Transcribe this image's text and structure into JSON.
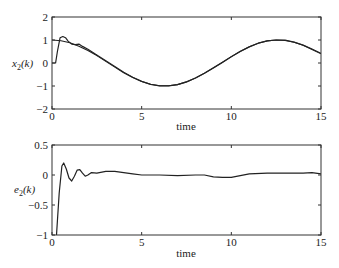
{
  "chart_data": [
    {
      "type": "line",
      "title": "",
      "xlabel": "time",
      "ylabel": "x2(k)",
      "ylabel_main": "x",
      "ylabel_sub": "2",
      "ylabel_tail": "(k)",
      "xlim": [
        0,
        15
      ],
      "ylim": [
        -2,
        2
      ],
      "xticks": [
        0,
        5,
        10,
        15
      ],
      "xtick_labels": [
        "0",
        "5",
        "10",
        "15"
      ],
      "yticks": [
        -2,
        -1,
        0,
        1,
        2
      ],
      "ytick_labels": [
        "−2",
        "−1",
        "0",
        "1",
        "2"
      ],
      "grid": false,
      "legend": null,
      "series": [
        {
          "name": "reference",
          "x": [
            0,
            0.5,
            1,
            1.5,
            2,
            2.5,
            3,
            3.5,
            4,
            4.5,
            5,
            5.5,
            6,
            6.5,
            7,
            7.5,
            8,
            8.5,
            9,
            9.5,
            10,
            10.5,
            11,
            11.5,
            12,
            12.5,
            13,
            13.5,
            14,
            14.5,
            15
          ],
          "values": [
            1.0,
            0.97,
            0.88,
            0.73,
            0.54,
            0.32,
            0.07,
            -0.18,
            -0.42,
            -0.63,
            -0.8,
            -0.92,
            -0.99,
            -0.99,
            -0.94,
            -0.82,
            -0.65,
            -0.45,
            -0.21,
            0.03,
            0.28,
            0.51,
            0.71,
            0.86,
            0.96,
            1.0,
            0.98,
            0.9,
            0.77,
            0.59,
            0.4
          ]
        },
        {
          "name": "actual",
          "x": [
            0,
            0.2,
            0.3,
            0.45,
            0.6,
            0.75,
            0.9,
            1.1,
            1.3,
            1.5,
            1.7,
            2,
            2.5,
            3,
            3.5,
            4,
            4.5,
            5,
            5.5,
            6,
            6.5,
            7,
            7.5,
            8,
            8.5,
            9,
            9.5,
            10,
            10.5,
            11,
            11.5,
            12,
            12.5,
            13,
            13.5,
            14,
            14.5,
            15
          ],
          "values": [
            0.0,
            0.0,
            0.5,
            1.1,
            1.15,
            1.1,
            0.95,
            0.82,
            0.8,
            0.82,
            0.72,
            0.6,
            0.35,
            0.1,
            -0.15,
            -0.4,
            -0.62,
            -0.8,
            -0.93,
            -0.99,
            -0.99,
            -0.94,
            -0.82,
            -0.65,
            -0.45,
            -0.22,
            0.02,
            0.27,
            0.5,
            0.7,
            0.86,
            0.96,
            1.0,
            0.99,
            0.91,
            0.78,
            0.61,
            0.42
          ]
        }
      ]
    },
    {
      "type": "line",
      "title": "",
      "xlabel": "time",
      "ylabel": "e2(k)",
      "ylabel_main": "e",
      "ylabel_sub": "2",
      "ylabel_tail": "(k)",
      "xlim": [
        0,
        15
      ],
      "ylim": [
        -1,
        0.5
      ],
      "xticks": [
        0,
        5,
        10,
        15
      ],
      "xtick_labels": [
        "0",
        "5",
        "10",
        "15"
      ],
      "yticks": [
        -1,
        -0.5,
        0,
        0.5
      ],
      "ytick_labels": [
        "−1",
        "−0.5",
        "0",
        "0.5"
      ],
      "grid": false,
      "legend": null,
      "series": [
        {
          "name": "error",
          "x": [
            0.25,
            0.4,
            0.55,
            0.65,
            0.8,
            0.95,
            1.1,
            1.25,
            1.4,
            1.55,
            1.7,
            1.85,
            2.0,
            2.2,
            2.5,
            3.0,
            3.5,
            4.0,
            4.5,
            5.0,
            6.0,
            7.0,
            8.0,
            8.5,
            9.0,
            9.5,
            10.0,
            10.5,
            11.0,
            12.0,
            13.0,
            14.0,
            14.5,
            15.0
          ],
          "values": [
            -1.0,
            -0.3,
            0.15,
            0.2,
            0.1,
            -0.05,
            -0.1,
            -0.02,
            0.08,
            0.09,
            0.03,
            -0.02,
            0.0,
            0.04,
            0.03,
            0.06,
            0.06,
            0.04,
            0.02,
            0.0,
            0.0,
            -0.01,
            0.0,
            0.0,
            -0.03,
            -0.04,
            -0.04,
            -0.01,
            0.02,
            0.03,
            0.03,
            0.03,
            0.04,
            0.02
          ]
        }
      ]
    }
  ],
  "colors": {
    "line": "#222222",
    "axis": "#333333",
    "background": "#ffffff"
  }
}
